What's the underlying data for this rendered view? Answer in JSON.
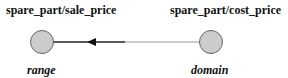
{
  "diagram": {
    "nodes": [
      {
        "id": "left",
        "title": "spare_part/sale_price",
        "role": "range"
      },
      {
        "id": "right",
        "title": "spare_part/cost_price",
        "role": "domain"
      }
    ],
    "edge": {
      "from": "right",
      "to": "left",
      "direction": "right-to-left"
    },
    "colors": {
      "node_fill": "#cccccc",
      "node_stroke": "#666666",
      "edge_dark": "#222222",
      "edge_light": "#888888"
    }
  }
}
